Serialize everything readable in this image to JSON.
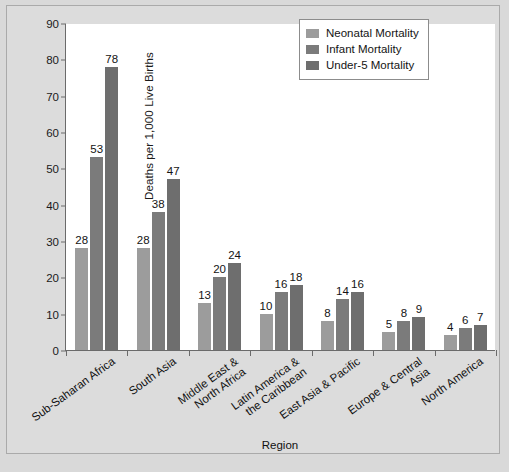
{
  "chart_data": {
    "type": "bar",
    "title": "",
    "xlabel": "Region",
    "ylabel": "Deaths per 1,000 Live Births",
    "ylim": [
      0,
      90
    ],
    "ytick_step": 10,
    "yticks": [
      0,
      10,
      20,
      30,
      40,
      50,
      60,
      70,
      80,
      90
    ],
    "grid": false,
    "legend_position": "top-right",
    "categories": [
      "Sub-Saharan Africa",
      "South Asia",
      "Middle East &\nNorth Africa",
      "Latin America &\nthe Caribbean",
      "East Asia & Pacific",
      "Europe & Central\nAsia",
      "North America"
    ],
    "category_lines": [
      [
        "Sub-Saharan Africa"
      ],
      [
        "South Asia"
      ],
      [
        "Middle East &",
        "North Africa"
      ],
      [
        "Latin America &",
        "the Caribbean"
      ],
      [
        "East Asia & Pacific"
      ],
      [
        "Europe & Central",
        "Asia"
      ],
      [
        "North America"
      ]
    ],
    "series": [
      {
        "name": "Neonatal Mortality",
        "color": "#9c9c9c",
        "values": [
          28,
          28,
          13,
          10,
          8,
          5,
          4
        ]
      },
      {
        "name": "Infant Mortality",
        "color": "#7b7b7b",
        "values": [
          53,
          38,
          20,
          16,
          14,
          8,
          6
        ]
      },
      {
        "name": "Under-5 Mortality",
        "color": "#6e6e6e",
        "values": [
          78,
          47,
          24,
          18,
          16,
          9,
          7
        ]
      }
    ]
  },
  "legend": {
    "items": [
      {
        "label": "Neonatal Mortality",
        "color": "#9c9c9c"
      },
      {
        "label": "Infant Mortality",
        "color": "#7b7b7b"
      },
      {
        "label": "Under-5 Mortality",
        "color": "#6e6e6e"
      }
    ]
  },
  "axes": {
    "y_title": "Deaths per 1,000 Live Births",
    "x_title": "Region",
    "y_tick_labels": [
      "0",
      "10",
      "20",
      "30",
      "40",
      "50",
      "60",
      "70",
      "80",
      "90"
    ]
  }
}
